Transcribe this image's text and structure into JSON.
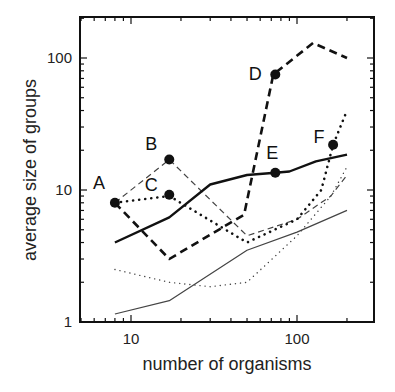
{
  "chart_data": {
    "type": "line",
    "title": "",
    "xlabel": "number of organisms",
    "ylabel": "average size of groups",
    "xscale": "log",
    "yscale": "log",
    "xlim": [
      4.75,
      295
    ],
    "ylim": [
      1,
      205
    ],
    "grid": false,
    "legend": "none",
    "x_ticks": [
      {
        "value": 10,
        "label": "10"
      },
      {
        "value": 100,
        "label": "100"
      }
    ],
    "y_ticks": [
      {
        "value": 1,
        "label": "1"
      },
      {
        "value": 10,
        "label": "10"
      },
      {
        "value": 100,
        "label": "100"
      }
    ],
    "series": [
      {
        "name": "heavy-dashed (A-D)",
        "style": "heavy-dashed",
        "x": [
          8,
          17,
          48,
          72,
          125,
          200
        ],
        "y": [
          8,
          3,
          6.5,
          75,
          130,
          100
        ]
      },
      {
        "name": "thin-dashed (A-B)",
        "style": "thin-dashed",
        "x": [
          8,
          17,
          50,
          100,
          160,
          200
        ],
        "y": [
          8,
          17,
          4.5,
          6,
          9,
          13
        ]
      },
      {
        "name": "heavy-dotted (A-C-F)",
        "style": "heavy-dotted",
        "x": [
          8,
          17,
          50,
          100,
          140,
          165,
          200
        ],
        "y": [
          8,
          9,
          4,
          6,
          10,
          22,
          40
        ]
      },
      {
        "name": "heavy-solid (E)",
        "style": "heavy-solid",
        "x": [
          8,
          17,
          30,
          50,
          74,
          90,
          130,
          200
        ],
        "y": [
          4,
          6.2,
          11,
          13,
          13.5,
          13.8,
          16.5,
          18.5
        ]
      },
      {
        "name": "thin-dotted",
        "style": "thin-dotted",
        "x": [
          8,
          17,
          30,
          50,
          100,
          160,
          200
        ],
        "y": [
          2.5,
          2,
          1.85,
          2,
          4.5,
          9,
          15
        ]
      },
      {
        "name": "thin-solid",
        "style": "thin-solid",
        "x": [
          8,
          17,
          50,
          100,
          200
        ],
        "y": [
          1.15,
          1.45,
          3.5,
          4.8,
          7
        ]
      }
    ],
    "annotations": [
      {
        "label": "A",
        "x": 8,
        "y": 8,
        "marker": true,
        "dx": -16,
        "dy": -14
      },
      {
        "label": "B",
        "x": 17,
        "y": 17,
        "marker": true,
        "dx": -18,
        "dy": -10
      },
      {
        "label": "C",
        "x": 17,
        "y": 9.2,
        "marker": true,
        "dx": -18,
        "dy": -4
      },
      {
        "label": "D",
        "x": 74,
        "y": 75,
        "marker": true,
        "dx": -20,
        "dy": 6
      },
      {
        "label": "E",
        "x": 74,
        "y": 13.5,
        "marker": true,
        "dx": -3,
        "dy": -14
      },
      {
        "label": "F",
        "x": 165,
        "y": 22,
        "marker": true,
        "dx": -14,
        "dy": -2
      }
    ]
  }
}
